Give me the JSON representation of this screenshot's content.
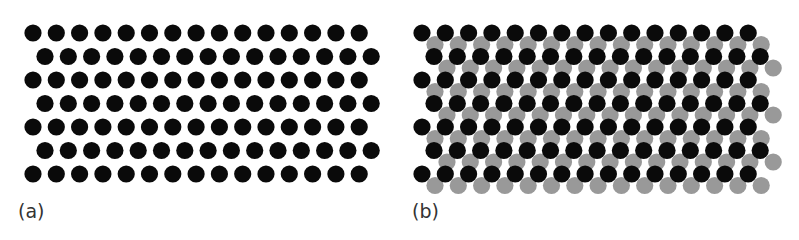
{
  "panels": [
    {
      "id": "a",
      "label": "(a)",
      "label_pos": [
        18,
        200
      ],
      "black_lattice": {
        "x0": 33,
        "y0": 33,
        "dx": 23.3,
        "dy": 23.5,
        "rows": 7,
        "odd_row_offset": 12,
        "cols": 15
      },
      "gray_lattice": null
    },
    {
      "id": "b",
      "label": "(b)",
      "label_pos": [
        412,
        200
      ],
      "black_lattice": {
        "x0": 422,
        "y0": 33,
        "dx": 23.3,
        "dy": 23.5,
        "rows": 7,
        "odd_row_offset": 12,
        "cols": 15
      },
      "gray_lattice": {
        "x0": 435,
        "y0": 44.5,
        "dx": 23.3,
        "dy": 23.5,
        "rows": 7,
        "odd_row_offset": 12,
        "cols": 15
      }
    }
  ],
  "style": {
    "radius": 8.6,
    "black": "#0a0a0a",
    "gray": "#999999"
  }
}
